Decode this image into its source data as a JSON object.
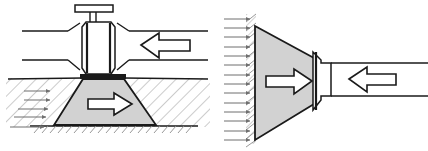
{
  "figure": {
    "type": "engineering-line-diagram",
    "background_color": "#ffffff",
    "line_color": "#1a1a1a",
    "fill_gray": "#d2d2d2",
    "hatch_color": "#8d8d8d",
    "flow_arrow_color": "#6f6f6f",
    "width": 428,
    "height": 151,
    "panel_count": 2
  },
  "panels": [
    {
      "id": "left-panel",
      "name": "valve-with-trapezoidal-thrust-block",
      "description": "Gate valve on a horizontal pipeline seated on a trapezoidal thrust block bearing against undisturbed soil",
      "components": {
        "handwheel": {
          "name": "handwheel",
          "shape": "horizontal-bar",
          "x": 75,
          "y": 4,
          "width": 38,
          "height": 7
        },
        "stem": {
          "name": "valve-stem",
          "shape": "vertical-double-line",
          "x": 92,
          "y_top": 11,
          "y_bottom": 22
        },
        "bonnet_body": {
          "name": "valve-body",
          "shape": "chamfered-rectangle",
          "x": 80,
          "y": 22,
          "width": 33,
          "height": 50,
          "fill": "#ffffff"
        },
        "pipe_left": {
          "name": "pipe-upstream",
          "x_start": 22,
          "x_end": 66,
          "y_top": 30,
          "y_bottom": 61
        },
        "pipe_right": {
          "name": "pipe-downstream",
          "x_start": 127,
          "x_end": 208,
          "y_top": 30,
          "y_bottom": 61
        },
        "thrust_block": {
          "name": "trapezoidal-thrust-block",
          "shape": "trapezoid",
          "top_left_x": 83,
          "top_right_x": 124,
          "top_y": 78,
          "bottom_left_x": 54,
          "bottom_right_x": 156,
          "bottom_y": 125,
          "fill": "#d2d2d2"
        },
        "ground_line": {
          "name": "ground-surface-line",
          "y": 78,
          "x_start": 8,
          "x_end": 208
        },
        "base_rock_line": {
          "name": "bearing-stratum-line",
          "y": 125,
          "x_start": 30,
          "x_end": 198
        }
      },
      "arrows": {
        "pipe_flow_arrow": {
          "name": "pipe-thrust-arrow",
          "direction": "left",
          "style": "hollow-block",
          "x": 142,
          "y": 33,
          "width": 48,
          "height": 24
        },
        "reaction_arrow": {
          "name": "soil-reaction-arrow",
          "direction": "right",
          "style": "hollow-block",
          "x": 88,
          "y": 93,
          "width": 44,
          "height": 22
        },
        "soil_pressure_arrows": {
          "name": "passive-soil-pressure-arrows",
          "direction": "right",
          "style": "thin-line",
          "count": 5,
          "y_positions": [
            91,
            100,
            109,
            117,
            127
          ],
          "x_lengths": [
            26,
            26,
            30,
            32,
            34
          ]
        }
      },
      "hatching": {
        "name": "soil-hatching",
        "pattern": "diagonal-45",
        "regions": [
          "left-of-block",
          "right-of-block",
          "below-bearing-line"
        ]
      }
    },
    {
      "id": "right-panel",
      "name": "dead-end-with-wedge-thrust-block",
      "description": "Pipe dead end with flanged cap bearing on a wedge shaped thrust block against a vertical hatched earth face",
      "components": {
        "earth_face": {
          "name": "vertical-earth-face",
          "shape": "hatched-vertical-wall",
          "x": 254,
          "y_top": 14,
          "y_bottom": 143
        },
        "thrust_block": {
          "name": "wedge-thrust-block",
          "shape": "triangle-trapezoid",
          "left_x": 254,
          "top_y": 26,
          "bottom_y": 140,
          "right_x": 314,
          "right_top_y": 58,
          "right_bottom_y": 104,
          "fill": "#d2d2d2"
        },
        "flange_cap": {
          "name": "flanged-end-cap",
          "shape": "bell-flange",
          "x": 313,
          "y_top": 50,
          "y_bottom": 112,
          "width": 18,
          "fill": "#ffffff"
        },
        "pipe": {
          "name": "pipe-run",
          "x_start": 331,
          "x_end": 428,
          "y_top": 63,
          "y_bottom": 96
        }
      },
      "arrows": {
        "pipe_flow_arrow": {
          "name": "pipe-thrust-arrow",
          "direction": "left",
          "style": "hollow-block",
          "x": 350,
          "y": 66,
          "width": 46,
          "height": 24
        },
        "reaction_arrow": {
          "name": "block-reaction-arrow",
          "direction": "right",
          "style": "hollow-block",
          "x": 266,
          "y": 70,
          "width": 46,
          "height": 22
        },
        "soil_pressure_arrows": {
          "name": "passive-soil-pressure-arrows",
          "direction": "right",
          "style": "thin-line",
          "count": 14,
          "y_start": 19,
          "y_end": 141,
          "x_start": 224,
          "x_end": 252
        }
      },
      "hatching": {
        "name": "earth-face-hatching",
        "pattern": "diagonal-45",
        "regions": [
          "vertical-strip-left-of-block"
        ]
      }
    }
  ]
}
